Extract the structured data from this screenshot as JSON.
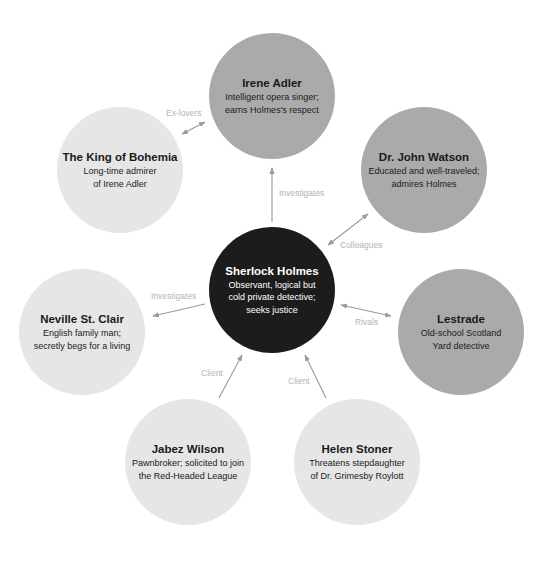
{
  "diagram": {
    "colors": {
      "central": "#1c1c1c",
      "major": "#aaaaaa",
      "minor": "#e6e6e6",
      "arrow": "#9a9a9a",
      "label": "#b4b4b4"
    },
    "nodes": [
      {
        "id": "sherlock",
        "title": "Sherlock Holmes",
        "description": "Observant, logical but\ncold private detective;\nseeks justice",
        "tone": "dark",
        "cx": 272,
        "cy": 290,
        "r": 63
      },
      {
        "id": "irene",
        "title": "Irene Adler",
        "description": "Intelligent opera singer;\nearns Holmes's respect",
        "tone": "mid",
        "cx": 272,
        "cy": 96,
        "r": 63
      },
      {
        "id": "king",
        "title": "The King of Bohemia",
        "description": "Long-time admirer\nof Irene Adler",
        "tone": "light",
        "cx": 120,
        "cy": 170,
        "r": 63
      },
      {
        "id": "watson",
        "title": "Dr. John Watson",
        "description": "Educated and well-traveled;\nadmires Holmes",
        "tone": "mid",
        "cx": 424,
        "cy": 170,
        "r": 63
      },
      {
        "id": "neville",
        "title": "Neville St. Clair",
        "description": "English family man;\nsecretly begs for a living",
        "tone": "light",
        "cx": 82,
        "cy": 332,
        "r": 63
      },
      {
        "id": "lestrade",
        "title": "Lestrade",
        "description": "Old-school Scotland\nYard detective",
        "tone": "mid",
        "cx": 461,
        "cy": 332,
        "r": 63
      },
      {
        "id": "jabez",
        "title": "Jabez Wilson",
        "description": "Pawnbroker; solicited to join\nthe Red-Headed League",
        "tone": "light",
        "cx": 188,
        "cy": 462,
        "r": 63
      },
      {
        "id": "helen",
        "title": "Helen Stoner",
        "description": "Threatens stepdaughter\nof Dr. Grimesby Roylott",
        "tone": "light",
        "cx": 357,
        "cy": 462,
        "r": 63
      }
    ],
    "edges": [
      {
        "from": "sherlock",
        "to": "irene",
        "label": "Investigates",
        "direction": "forward",
        "x1": 272,
        "y1": 222,
        "x2": 272,
        "y2": 168,
        "lx": 279,
        "ly": 188
      },
      {
        "from": "king",
        "to": "irene",
        "label": "Ex-lovers",
        "direction": "both",
        "x1": 182,
        "y1": 134,
        "x2": 205,
        "y2": 122,
        "lx": 166,
        "ly": 108
      },
      {
        "from": "sherlock",
        "to": "watson",
        "label": "Colleagues",
        "direction": "both",
        "x1": 328,
        "y1": 245,
        "x2": 368,
        "y2": 214,
        "lx": 340,
        "ly": 240
      },
      {
        "from": "sherlock",
        "to": "neville",
        "label": "Investigates",
        "direction": "forward",
        "x1": 205,
        "y1": 304,
        "x2": 153,
        "y2": 316,
        "lx": 151,
        "ly": 291
      },
      {
        "from": "sherlock",
        "to": "lestrade",
        "label": "Rivals",
        "direction": "both",
        "x1": 341,
        "y1": 305,
        "x2": 391,
        "y2": 316,
        "lx": 355,
        "ly": 317
      },
      {
        "from": "jabez",
        "to": "sherlock",
        "label": "Client",
        "direction": "forward",
        "x1": 219,
        "y1": 398,
        "x2": 242,
        "y2": 355,
        "lx": 201,
        "ly": 368
      },
      {
        "from": "helen",
        "to": "sherlock",
        "label": "Client",
        "direction": "forward",
        "x1": 326,
        "y1": 398,
        "x2": 305,
        "y2": 355,
        "lx": 288,
        "ly": 376
      }
    ]
  }
}
